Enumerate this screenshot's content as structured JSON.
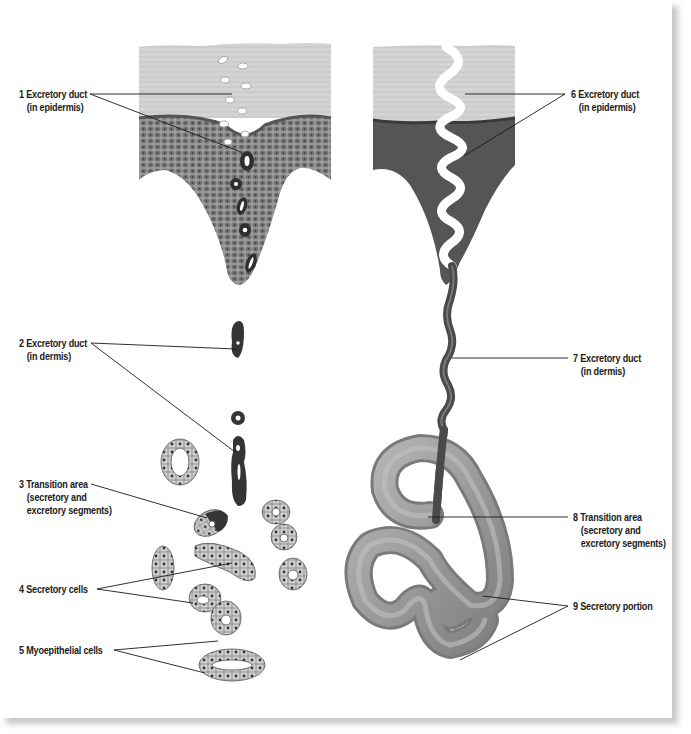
{
  "diagram": {
    "colors": {
      "stratum_corneum": "#d6d6d6",
      "epidermis_cells": "#8a8a8a",
      "epidermis_dark": "#4a4a4a",
      "duct_dark": "#3a3a3a",
      "secretory_cells": "#c8c8c8",
      "coil": "#9a9a9a",
      "leader_line": "#1a1a1a",
      "frame_shadow": "#c8c8c8"
    },
    "labels": [
      {
        "id": 1,
        "line1": "1 Excretory duct",
        "line2": "(in epidermis)",
        "side": "left"
      },
      {
        "id": 2,
        "line1": "2 Excretory duct",
        "line2": "(in dermis)",
        "side": "left"
      },
      {
        "id": 3,
        "line1": "3 Transition area",
        "line2": "(secretory and",
        "line3": "excretory segments)",
        "side": "left"
      },
      {
        "id": 4,
        "line1": "4 Secretory cells",
        "side": "left"
      },
      {
        "id": 5,
        "line1": "5 Myoepithelial cells",
        "side": "left"
      },
      {
        "id": 6,
        "line1": "6 Excretory duct",
        "line2": "(in epidermis)",
        "side": "right"
      },
      {
        "id": 7,
        "line1": "7 Excretory duct",
        "line2": "(in dermis)",
        "side": "right"
      },
      {
        "id": 8,
        "line1": "8 Transition area",
        "line2": "(secretory and",
        "line3": "excretory segments)",
        "side": "right"
      },
      {
        "id": 9,
        "line1": "9 Secretory portion",
        "side": "right"
      }
    ]
  }
}
